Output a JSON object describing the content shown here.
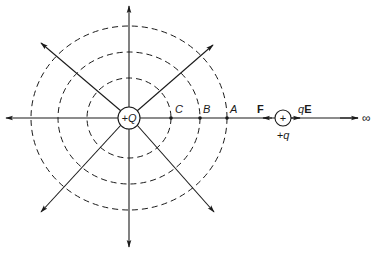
{
  "diagram": {
    "type": "electric-field-diagram",
    "colors": {
      "ink": "#1a1a1a",
      "background": "#ffffff"
    },
    "source_charge": {
      "label": "+Q",
      "cx": 129,
      "cy": 118,
      "r": 11
    },
    "equipotential_circles": [
      {
        "name": "through-C",
        "rx": 42,
        "ry": 40
      },
      {
        "name": "through-B",
        "rx": 71,
        "ry": 66
      },
      {
        "name": "through-A",
        "rx": 98,
        "ry": 92
      }
    ],
    "points": [
      {
        "label": "C",
        "x": 171,
        "y": 118
      },
      {
        "label": "B",
        "x": 200,
        "y": 118
      },
      {
        "label": "A",
        "x": 227,
        "y": 118
      }
    ],
    "test_charge": {
      "symbol": "+",
      "label": "+q",
      "cx": 283,
      "cy": 118,
      "r": 8
    },
    "force_labels": {
      "F": "F",
      "qE_q": "q",
      "qE_E": "E"
    },
    "infinity_label": "∞"
  }
}
